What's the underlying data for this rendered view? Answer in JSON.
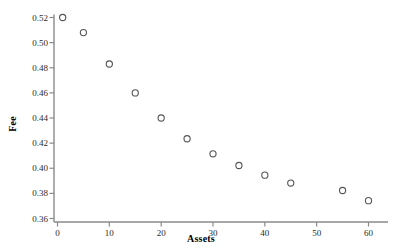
{
  "chart_data": {
    "type": "scatter",
    "title": "",
    "xlabel": "Assets",
    "ylabel": "Fee",
    "xlim": [
      0,
      62
    ],
    "ylim": [
      0.36,
      0.525
    ],
    "grid": false,
    "legend": null,
    "marker": "open-circle",
    "marker_color": "#555555",
    "x": [
      1,
      5,
      10,
      15,
      20,
      25,
      30,
      35,
      40,
      45,
      55,
      60
    ],
    "y": [
      0.52,
      0.508,
      0.483,
      0.46,
      0.44,
      0.4235,
      0.4115,
      0.4022,
      0.3945,
      0.3882,
      0.3823,
      0.3742
    ],
    "points": [
      {
        "x": 1,
        "y": 0.52
      },
      {
        "x": 5,
        "y": 0.508
      },
      {
        "x": 10,
        "y": 0.483
      },
      {
        "x": 15,
        "y": 0.46
      },
      {
        "x": 20,
        "y": 0.44
      },
      {
        "x": 25,
        "y": 0.4235
      },
      {
        "x": 30,
        "y": 0.4115
      },
      {
        "x": 35,
        "y": 0.4022
      },
      {
        "x": 40,
        "y": 0.3945
      },
      {
        "x": 45,
        "y": 0.3882
      },
      {
        "x": 55,
        "y": 0.3823
      },
      {
        "x": 60,
        "y": 0.3742
      }
    ],
    "xticks": [
      0,
      10,
      20,
      30,
      40,
      50,
      60
    ],
    "xtick_labels": [
      "0",
      "10",
      "20",
      "30",
      "40",
      "50",
      "60"
    ],
    "yticks": [
      0.36,
      0.38,
      0.4,
      0.42,
      0.44,
      0.46,
      0.48,
      0.5,
      0.52
    ],
    "ytick_labels": [
      "0.36",
      "0.38",
      "0.40",
      "0.42",
      "0.44",
      "0.46",
      "0.48",
      "0.50",
      "0.52"
    ],
    "axis_color": "#8a8a8a"
  }
}
